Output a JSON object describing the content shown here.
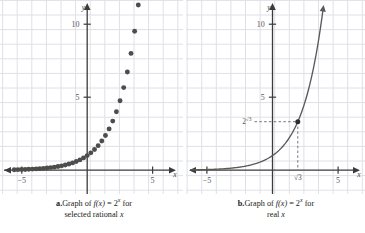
{
  "figure": {
    "panels": [
      {
        "id": "a",
        "name": "graph-selected-rational",
        "caption_label": "a.",
        "caption_line1_pre": "Graph of ",
        "caption_fn": "f(x)",
        "caption_eq": " = 2",
        "caption_exp": "x",
        "caption_line1_post": " for",
        "caption_line2_pre": "selected rational ",
        "caption_line2_var": "x",
        "x_axis_label": "x",
        "y_axis_label": "y",
        "x_ticks": [
          {
            "value": -5,
            "label": "−5"
          },
          {
            "value": 5,
            "label": "5"
          }
        ],
        "y_ticks": [
          {
            "value": 5,
            "label": "5"
          },
          {
            "value": 10,
            "label": "10"
          }
        ]
      },
      {
        "id": "b",
        "name": "graph-real",
        "caption_label": "b.",
        "caption_line1_pre": "Graph of ",
        "caption_fn": "f(x)",
        "caption_eq": " = 2",
        "caption_exp": "x",
        "caption_line1_post": " for",
        "caption_line2_pre": "real ",
        "caption_line2_var": "x",
        "x_axis_label": "x",
        "y_axis_label": "y",
        "x_ticks": [
          {
            "value": -5,
            "label": "−5"
          },
          {
            "value": 5,
            "label": "5"
          }
        ],
        "y_ticks": [
          {
            "value": 5,
            "label": "5"
          },
          {
            "value": 10,
            "label": "10"
          }
        ],
        "point_x_label_base": "√3",
        "point_y_label_base": "2",
        "point_y_label_exp": "√3",
        "point_x_value": 1.732,
        "point_y_value": 3.322
      }
    ]
  },
  "style": {
    "grid_color": "#dfe0e6",
    "axis_color": "#3b3b3b",
    "curve_color": "#5a5a5a",
    "dot_color": "#4d4d4d",
    "text_color": "#1a1a1a",
    "tick_label_color": "#555555",
    "dashed_color": "#777777"
  },
  "chart_data": [
    {
      "type": "scatter",
      "title": "Graph of f(x) = 2^x for selected rational x",
      "xlabel": "x",
      "ylabel": "y",
      "xlim": [
        -6.0,
        6.2
      ],
      "ylim": [
        -1.6,
        11.8
      ],
      "xticks": [
        -5,
        5
      ],
      "yticks": [
        5,
        10
      ],
      "grid": true,
      "function": "f(x) = 2^x",
      "x": [
        -5,
        -4.75,
        -4.5,
        -4.25,
        -4,
        -3.75,
        -3.5,
        -3.25,
        -3,
        -2.75,
        -2.5,
        -2.25,
        -2,
        -1.75,
        -1.5,
        -1.25,
        -1,
        -0.75,
        -0.5,
        -0.25,
        0,
        0.25,
        0.5,
        0.75,
        1,
        1.25,
        1.5,
        1.75,
        2,
        2.25,
        2.5,
        2.75,
        3,
        3.25,
        3.5
      ],
      "y": [
        0.031,
        0.037,
        0.044,
        0.053,
        0.063,
        0.074,
        0.088,
        0.105,
        0.125,
        0.149,
        0.177,
        0.21,
        0.25,
        0.297,
        0.354,
        0.42,
        0.5,
        0.595,
        0.707,
        0.841,
        1.0,
        1.189,
        1.414,
        1.682,
        2.0,
        2.378,
        2.828,
        3.364,
        4.0,
        4.757,
        5.657,
        6.727,
        8.0,
        9.514,
        11.314
      ]
    },
    {
      "type": "line",
      "title": "Graph of f(x) = 2^x for real x",
      "xlabel": "x",
      "ylabel": "y",
      "xlim": [
        -6.0,
        6.2
      ],
      "ylim": [
        -1.6,
        11.8
      ],
      "xticks": [
        -5,
        5
      ],
      "yticks": [
        5,
        10
      ],
      "grid": true,
      "function": "f(x) = 2^x",
      "annotations": [
        {
          "x": 1.732,
          "y": 3.322,
          "x_label": "√3",
          "y_label": "2^√3",
          "marker": "dot",
          "guides": "dashed"
        }
      ]
    }
  ]
}
